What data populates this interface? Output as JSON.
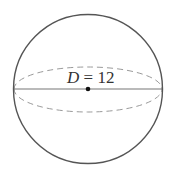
{
  "diagram": {
    "type": "sphere",
    "label": {
      "variable": "D",
      "equals": " = ",
      "value": "12"
    },
    "colors": {
      "outline": "#555555",
      "dashed": "#9a9a9a",
      "diameter": "#777777",
      "center_dot": "#111111",
      "text": "#333333"
    }
  }
}
